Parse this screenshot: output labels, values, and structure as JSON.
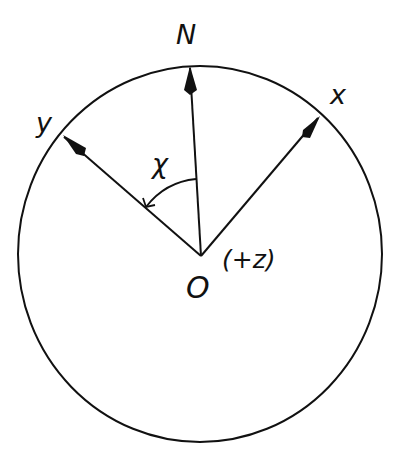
{
  "diagram": {
    "labels": {
      "north": "N",
      "x_axis": "x",
      "y_axis": "y",
      "angle": "χ",
      "origin": "O",
      "z_axis": "(+z)"
    },
    "colors": {
      "stroke": "#111111",
      "background": "#ffffff"
    }
  }
}
